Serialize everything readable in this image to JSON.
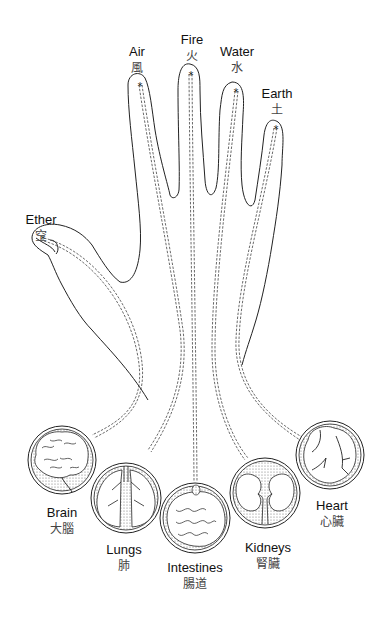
{
  "diagram": {
    "type": "hand-element-organ-meridian-map",
    "fingers": [
      {
        "element_en": "Air",
        "element_cn": "風",
        "x": 137,
        "y": 44
      },
      {
        "element_en": "Fire",
        "element_cn": "火",
        "x": 192,
        "y": 32
      },
      {
        "element_en": "Water",
        "element_cn": "水",
        "x": 237,
        "y": 44
      },
      {
        "element_en": "Earth",
        "element_cn": "土",
        "x": 277,
        "y": 86
      },
      {
        "element_en": "Ether",
        "element_cn": "空",
        "x": 41,
        "y": 212
      }
    ],
    "organs": [
      {
        "name_en": "Brain",
        "name_cn": "大腦",
        "x": 62,
        "y": 505
      },
      {
        "name_en": "Lungs",
        "name_cn": "肺",
        "x": 124,
        "y": 542
      },
      {
        "name_en": "Intestines",
        "name_cn": "腸道",
        "x": 195,
        "y": 560
      },
      {
        "name_en": "Kidneys",
        "name_cn": "腎臟",
        "x": 268,
        "y": 540
      },
      {
        "name_en": "Heart",
        "name_cn": "心臟",
        "x": 332,
        "y": 498
      }
    ],
    "marker_symbol": "*"
  }
}
